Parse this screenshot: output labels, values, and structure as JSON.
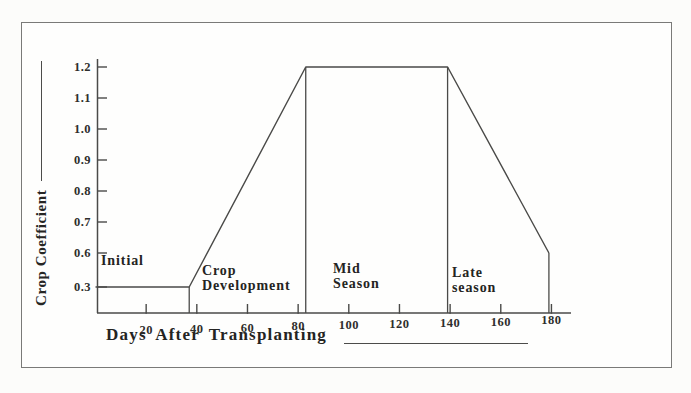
{
  "figure": {
    "background": "#fcfcfa",
    "border_color": "#7a7a78",
    "line_color": "#4a4a48",
    "text_color": "#262624"
  },
  "chart_data": {
    "type": "line",
    "title": "",
    "xlabel": "Days After Transplanting",
    "ylabel": "Crop Coefficient",
    "x_ticks": [
      20,
      40,
      60,
      80,
      100,
      120,
      140,
      160,
      180
    ],
    "y_ticks": [
      "1.2",
      "1.1",
      "1.0",
      "0.9",
      "0.8",
      "0.7",
      "0.6",
      "0.3"
    ],
    "xlim": [
      0,
      188
    ],
    "ylim_displayed": [
      0.3,
      1.2
    ],
    "grid": false,
    "legend": "none",
    "series": [
      {
        "name": "crop-coefficient-curve",
        "points": [
          [
            0,
            0.3
          ],
          [
            37,
            0.3
          ],
          [
            83,
            1.2
          ],
          [
            139,
            1.2
          ],
          [
            179,
            0.6
          ]
        ]
      }
    ],
    "stage_separators": [
      {
        "day": 37,
        "kc_top": 0.3
      },
      {
        "day": 83,
        "kc_top": 1.2
      },
      {
        "day": 139,
        "kc_top": 1.2
      },
      {
        "day": 179,
        "kc_top": 0.6
      }
    ],
    "stages": [
      {
        "line1": "Initial",
        "line2": ""
      },
      {
        "line1": "Crop",
        "line2": "Development"
      },
      {
        "line1": "Mid",
        "line2": "Season"
      },
      {
        "line1": "Late",
        "line2": "season"
      }
    ]
  }
}
